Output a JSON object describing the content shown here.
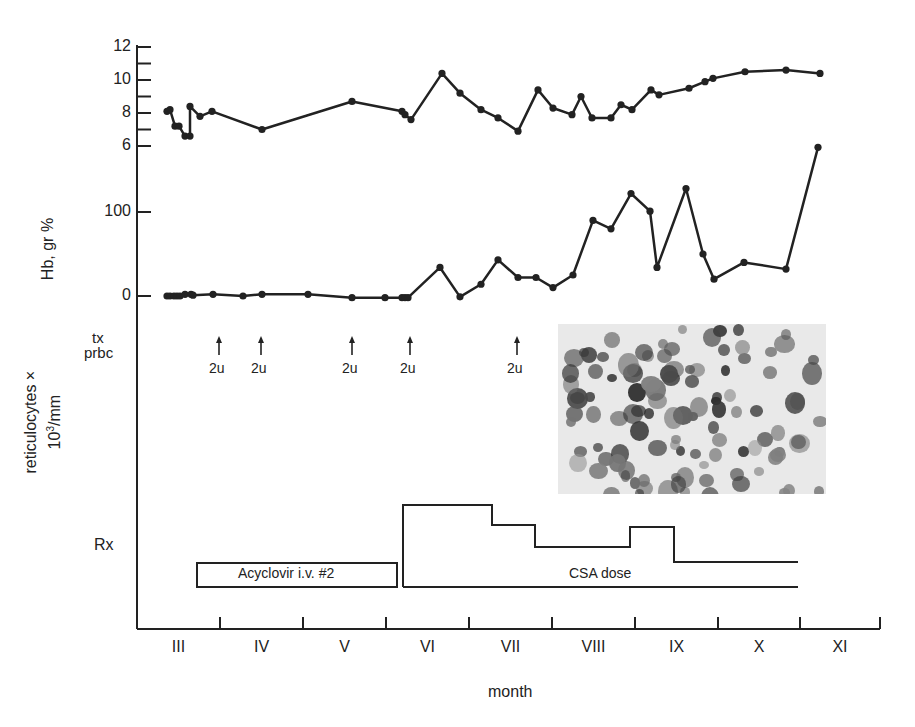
{
  "chart_data": {
    "type": "line",
    "title": "",
    "xlabel": "month",
    "x_ticks": [
      "III",
      "IV",
      "V",
      "VI",
      "VII",
      "VIII",
      "IX",
      "X",
      "XI"
    ],
    "panels": [
      {
        "name": "Hb",
        "ylabel": "Hb, gr %",
        "ylim": [
          6,
          12
        ],
        "y_ticks": [
          6,
          8,
          10,
          12
        ],
        "series": [
          {
            "name": "Hb",
            "points": [
              [
                167,
                8.1
              ],
              [
                170,
                8.2
              ],
              [
                175,
                7.2
              ],
              [
                179,
                7.2
              ],
              [
                185,
                6.6
              ],
              [
                190,
                6.6
              ],
              [
                190,
                8.4
              ],
              [
                200,
                7.8
              ],
              [
                212,
                8.1
              ],
              [
                262,
                7.0
              ],
              [
                352,
                8.7
              ],
              [
                402,
                8.1
              ],
              [
                405,
                7.9
              ],
              [
                411,
                7.6
              ],
              [
                442,
                10.4
              ],
              [
                460,
                9.2
              ],
              [
                481,
                8.2
              ],
              [
                498,
                7.7
              ],
              [
                518,
                6.9
              ],
              [
                538,
                9.4
              ],
              [
                553,
                8.3
              ],
              [
                572,
                7.9
              ],
              [
                581,
                9.0
              ],
              [
                592,
                7.7
              ],
              [
                611,
                7.7
              ],
              [
                621,
                8.5
              ],
              [
                632,
                8.2
              ],
              [
                651,
                9.4
              ],
              [
                659,
                9.1
              ],
              [
                689,
                9.5
              ],
              [
                705,
                9.9
              ],
              [
                713,
                10.1
              ],
              [
                745,
                10.5
              ],
              [
                786,
                10.6
              ],
              [
                820,
                10.4
              ]
            ]
          }
        ]
      },
      {
        "name": "reticulocytes",
        "ylabel": "reticulocytes × 10³/mm",
        "ylim": [
          0,
          100
        ],
        "y_ticks": [
          0,
          100
        ],
        "series": [
          {
            "name": "reticulocytes",
            "points": [
              [
                167,
                0
              ],
              [
                170,
                0
              ],
              [
                174,
                0
              ],
              [
                177,
                0
              ],
              [
                180,
                0
              ],
              [
                185,
                2
              ],
              [
                191,
                2
              ],
              [
                193,
                1
              ],
              [
                213,
                2
              ],
              [
                243,
                0
              ],
              [
                262,
                2
              ],
              [
                308,
                2
              ],
              [
                352,
                -2
              ],
              [
                385,
                -2
              ],
              [
                402,
                -2
              ],
              [
                405,
                -2
              ],
              [
                408,
                -2
              ],
              [
                440,
                34
              ],
              [
                460,
                -1
              ],
              [
                481,
                14
              ],
              [
                498,
                43
              ],
              [
                518,
                22
              ],
              [
                536,
                22
              ],
              [
                553,
                10
              ],
              [
                573,
                25
              ],
              [
                593,
                90
              ],
              [
                611,
                80
              ],
              [
                631,
                122
              ],
              [
                650,
                101
              ],
              [
                657,
                34
              ],
              [
                686,
                128
              ],
              [
                703,
                50
              ],
              [
                714,
                20
              ],
              [
                744,
                40
              ],
              [
                786,
                32
              ],
              [
                818,
                177
              ]
            ]
          }
        ]
      }
    ],
    "transfusions": {
      "label_line1": "tx",
      "label_line2": "prbc",
      "events": [
        {
          "x": 219,
          "label": "2u"
        },
        {
          "x": 261,
          "label": "2u"
        },
        {
          "x": 352,
          "label": "2u"
        },
        {
          "x": 410,
          "label": "2u"
        },
        {
          "x": 517,
          "label": "2u"
        }
      ]
    },
    "treatment": {
      "label": "Rx",
      "acyclovir": {
        "label": "Acyclovir i.v. #2",
        "x_start": 197,
        "x_end": 397
      },
      "csa": {
        "label": "CSA dose",
        "steps": [
          [
            403,
            505
          ],
          [
            492,
            505
          ],
          [
            492,
            525
          ],
          [
            535,
            525
          ],
          [
            535,
            547
          ],
          [
            630,
            547
          ],
          [
            630,
            527
          ],
          [
            674,
            527
          ],
          [
            674,
            562
          ],
          [
            798,
            562
          ]
        ]
      }
    },
    "inset": {
      "description": "micrograph of stained reticulocytes"
    }
  }
}
